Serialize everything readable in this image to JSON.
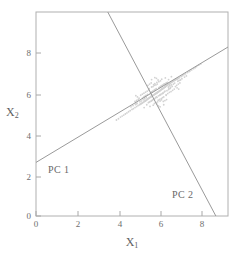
{
  "chart_data": {
    "type": "scatter",
    "title": "",
    "subtitle": "",
    "xlabel": "X1",
    "ylabel": "X2",
    "xlabel_base": "X",
    "xlabel_sub": "1",
    "ylabel_base": "X",
    "ylabel_sub": "2",
    "xlim": [
      0,
      9.5
    ],
    "ylim": [
      0,
      9.9
    ],
    "xticks": [
      0,
      2,
      4,
      6,
      8
    ],
    "yticks": [
      0,
      2,
      4,
      6,
      8
    ],
    "xticklabels": [
      "0",
      "2",
      "4",
      "6",
      "8"
    ],
    "yticklabels": [
      "0",
      "2",
      "4",
      "6",
      "8"
    ],
    "grid": false,
    "legend": false,
    "frame": "box",
    "point_color": "#d2d2d2",
    "line_color": "#9a9a9a",
    "axis_color": "#a8a8a8",
    "text_color": "#6e6e6e",
    "background": "#ffffff",
    "cluster": {
      "center_x": 6.0,
      "center_y": 6.0,
      "n_points": 260,
      "spread_major": 1.05,
      "spread_minor": 0.38,
      "major_axis_angle_deg": 30
    },
    "annotations": [
      {
        "name": "PC 1",
        "label": "PC 1",
        "line": {
          "x1": 0.0,
          "y1": 2.6,
          "x2": 9.5,
          "y2": 8.2
        },
        "slope": 0.59,
        "intercept": 2.6
      },
      {
        "name": "PC 2",
        "label": "PC 2",
        "line": {
          "x1": 3.55,
          "y1": 9.9,
          "x2": 8.9,
          "y2": 0.0
        },
        "slope": -1.85,
        "intercept": 16.5
      }
    ],
    "points": [
      [
        6.02,
        6.01
      ],
      [
        5.84,
        5.88
      ],
      [
        6.24,
        6.17
      ],
      [
        5.62,
        5.74
      ],
      [
        6.41,
        6.29
      ],
      [
        5.95,
        5.96
      ],
      [
        6.13,
        6.08
      ],
      [
        5.73,
        5.81
      ],
      [
        6.33,
        6.22
      ],
      [
        5.51,
        5.66
      ],
      [
        6.55,
        6.38
      ],
      [
        6.07,
        6.04
      ],
      [
        5.89,
        5.92
      ],
      [
        6.19,
        6.13
      ],
      [
        5.67,
        5.78
      ],
      [
        6.46,
        6.33
      ],
      [
        5.99,
        5.99
      ],
      [
        6.28,
        6.19
      ],
      [
        5.78,
        5.85
      ],
      [
        6.37,
        6.25
      ],
      [
        5.56,
        5.7
      ],
      [
        6.6,
        6.41
      ],
      [
        6.1,
        6.06
      ],
      [
        5.92,
        5.94
      ],
      [
        6.22,
        6.15
      ],
      [
        5.7,
        5.8
      ],
      [
        6.49,
        6.35
      ],
      [
        6.01,
        6.0
      ],
      [
        6.31,
        6.21
      ],
      [
        5.81,
        5.87
      ],
      [
        6.4,
        6.27
      ],
      [
        5.59,
        5.72
      ],
      [
        6.64,
        6.44
      ],
      [
        6.04,
        6.02
      ],
      [
        5.86,
        5.9
      ],
      [
        6.16,
        6.11
      ],
      [
        5.64,
        5.76
      ],
      [
        6.43,
        6.31
      ],
      [
        5.97,
        5.97
      ],
      [
        6.26,
        6.18
      ],
      [
        5.75,
        5.83
      ],
      [
        6.35,
        6.24
      ],
      [
        5.53,
        5.68
      ],
      [
        6.57,
        6.4
      ],
      [
        6.09,
        6.05
      ],
      [
        5.91,
        5.93
      ],
      [
        6.21,
        6.14
      ],
      [
        5.69,
        5.79
      ],
      [
        6.48,
        6.34
      ],
      [
        6.0,
        5.98
      ],
      [
        6.3,
        6.2
      ],
      [
        5.8,
        5.86
      ],
      [
        6.39,
        6.26
      ],
      [
        5.58,
        5.71
      ],
      [
        6.62,
        6.43
      ],
      [
        6.12,
        6.07
      ],
      [
        5.94,
        5.95
      ],
      [
        6.24,
        6.16
      ],
      [
        5.72,
        5.82
      ],
      [
        6.51,
        6.36
      ],
      [
        5.4,
        5.58
      ],
      [
        6.72,
        6.5
      ],
      [
        6.85,
        6.58
      ],
      [
        5.28,
        5.5
      ],
      [
        7.0,
        6.66
      ],
      [
        5.15,
        5.42
      ],
      [
        6.9,
        6.61
      ],
      [
        5.35,
        5.55
      ],
      [
        6.78,
        6.54
      ],
      [
        5.22,
        5.46
      ],
      [
        7.1,
        6.72
      ],
      [
        5.05,
        5.36
      ],
      [
        6.95,
        6.64
      ],
      [
        5.45,
        5.61
      ],
      [
        6.68,
        6.47
      ],
      [
        5.32,
        5.53
      ],
      [
        7.05,
        6.69
      ],
      [
        5.18,
        5.44
      ],
      [
        6.82,
        6.56
      ],
      [
        5.25,
        5.48
      ],
      [
        7.18,
        6.77
      ],
      [
        4.98,
        5.31
      ],
      [
        6.88,
        6.6
      ],
      [
        5.42,
        5.6
      ],
      [
        6.75,
        6.52
      ],
      [
        5.12,
        5.4
      ],
      [
        7.25,
        6.81
      ],
      [
        4.9,
        5.26
      ],
      [
        6.98,
        6.65
      ],
      [
        5.38,
        5.57
      ],
      [
        7.32,
        6.86
      ],
      [
        4.82,
        5.21
      ],
      [
        6.92,
        6.62
      ],
      [
        5.48,
        5.63
      ],
      [
        7.4,
        6.9
      ],
      [
        4.75,
        5.17
      ],
      [
        6.08,
        6.22
      ],
      [
        5.96,
        5.78
      ],
      [
        6.3,
        6.38
      ],
      [
        5.76,
        5.62
      ],
      [
        6.18,
        6.3
      ],
      [
        5.88,
        5.7
      ],
      [
        6.42,
        6.44
      ],
      [
        5.64,
        5.55
      ],
      [
        6.26,
        6.34
      ],
      [
        5.8,
        5.66
      ],
      [
        6.5,
        6.48
      ],
      [
        5.56,
        5.5
      ],
      [
        6.14,
        6.26
      ],
      [
        5.92,
        5.74
      ],
      [
        6.36,
        6.41
      ],
      [
        5.7,
        5.58
      ],
      [
        6.22,
        6.32
      ],
      [
        5.84,
        5.68
      ],
      [
        6.46,
        6.46
      ],
      [
        5.6,
        5.53
      ],
      [
        6.1,
        6.24
      ],
      [
        5.99,
        5.76
      ],
      [
        6.34,
        6.4
      ],
      [
        5.73,
        5.6
      ],
      [
        5.9,
        6.14
      ],
      [
        6.12,
        5.86
      ],
      [
        5.78,
        6.06
      ],
      [
        6.24,
        5.94
      ],
      [
        5.68,
        5.99
      ],
      [
        6.35,
        6.02
      ],
      [
        5.84,
        6.1
      ],
      [
        6.18,
        5.9
      ],
      [
        5.72,
        6.02
      ],
      [
        6.29,
        5.97
      ],
      [
        5.95,
        6.18
      ],
      [
        6.06,
        5.83
      ],
      [
        5.66,
        5.95
      ],
      [
        6.38,
        6.06
      ],
      [
        5.87,
        6.12
      ],
      [
        6.15,
        5.89
      ],
      [
        5.75,
        6.04
      ],
      [
        6.27,
        5.95
      ],
      [
        6.55,
        6.26
      ],
      [
        5.46,
        5.74
      ],
      [
        6.62,
        6.32
      ],
      [
        5.38,
        5.69
      ],
      [
        6.7,
        6.36
      ],
      [
        5.3,
        5.64
      ],
      [
        6.58,
        6.18
      ],
      [
        5.43,
        5.82
      ],
      [
        6.66,
        6.24
      ],
      [
        5.35,
        5.77
      ],
      [
        6.74,
        6.29
      ],
      [
        5.27,
        5.72
      ],
      [
        6.48,
        6.08
      ],
      [
        5.52,
        5.9
      ],
      [
        6.56,
        6.14
      ],
      [
        5.44,
        5.85
      ],
      [
        6.64,
        6.19
      ],
      [
        5.36,
        5.8
      ],
      [
        7.5,
        6.96
      ],
      [
        4.66,
        5.11
      ],
      [
        7.58,
        7.01
      ],
      [
        4.58,
        5.06
      ],
      [
        7.15,
        6.6
      ],
      [
        5.0,
        5.48
      ],
      [
        7.22,
        6.66
      ],
      [
        4.92,
        5.43
      ],
      [
        7.35,
        6.74
      ],
      [
        4.8,
        5.36
      ],
      [
        7.44,
        6.8
      ],
      [
        4.7,
        5.3
      ],
      [
        6.05,
        5.62
      ],
      [
        6.0,
        6.4
      ],
      [
        6.2,
        5.7
      ],
      [
        5.85,
        6.34
      ],
      [
        6.32,
        5.78
      ],
      [
        5.72,
        6.26
      ],
      [
        6.44,
        5.86
      ],
      [
        5.6,
        6.18
      ],
      [
        6.12,
        5.66
      ],
      [
        5.93,
        6.36
      ],
      [
        6.26,
        5.74
      ],
      [
        5.79,
        6.28
      ],
      [
        7.62,
        7.04
      ],
      [
        4.5,
        5.0
      ],
      [
        7.7,
        7.09
      ],
      [
        4.42,
        4.95
      ],
      [
        6.8,
        6.4
      ],
      [
        5.2,
        5.58
      ],
      [
        6.86,
        6.45
      ],
      [
        5.14,
        5.54
      ],
      [
        7.02,
        6.54
      ],
      [
        4.99,
        5.45
      ],
      [
        7.08,
        6.58
      ],
      [
        4.93,
        5.41
      ],
      [
        5.98,
        6.48
      ],
      [
        6.02,
        5.54
      ],
      [
        5.88,
        6.42
      ],
      [
        6.14,
        5.58
      ],
      [
        6.08,
        6.52
      ],
      [
        5.94,
        5.5
      ],
      [
        5.82,
        6.38
      ],
      [
        6.21,
        5.64
      ],
      [
        6.16,
        6.56
      ],
      [
        5.86,
        5.46
      ],
      [
        6.04,
        6.6
      ],
      [
        5.98,
        5.43
      ],
      [
        6.68,
        6.04
      ],
      [
        5.34,
        5.96
      ],
      [
        6.76,
        6.1
      ],
      [
        5.26,
        5.91
      ],
      [
        6.84,
        6.16
      ],
      [
        5.18,
        5.86
      ],
      [
        6.52,
        5.94
      ],
      [
        5.5,
        6.06
      ],
      [
        6.6,
        6.0
      ],
      [
        5.42,
        6.01
      ],
      [
        6.44,
        5.88
      ],
      [
        5.58,
        6.12
      ],
      [
        7.8,
        7.15
      ],
      [
        4.34,
        4.9
      ],
      [
        7.88,
        7.2
      ],
      [
        4.26,
        4.85
      ],
      [
        7.95,
        7.25
      ],
      [
        4.18,
        4.8
      ],
      [
        6.96,
        6.34
      ],
      [
        5.06,
        5.66
      ],
      [
        7.04,
        6.4
      ],
      [
        4.98,
        5.61
      ],
      [
        7.12,
        6.46
      ],
      [
        4.9,
        5.56
      ],
      [
        5.7,
        6.46
      ],
      [
        6.3,
        5.56
      ],
      [
        5.62,
        6.4
      ],
      [
        6.38,
        5.6
      ],
      [
        5.54,
        6.34
      ],
      [
        6.46,
        5.65
      ],
      [
        6.9,
        6.28
      ],
      [
        5.1,
        5.72
      ],
      [
        6.98,
        6.22
      ],
      [
        5.02,
        5.78
      ],
      [
        7.06,
        6.16
      ],
      [
        4.94,
        5.84
      ],
      [
        5.96,
        6.68
      ],
      [
        6.06,
        5.34
      ],
      [
        5.88,
        6.72
      ],
      [
        6.14,
        5.3
      ],
      [
        6.22,
        6.64
      ],
      [
        5.8,
        5.38
      ],
      [
        6.4,
        6.7
      ],
      [
        5.64,
        5.32
      ],
      [
        5.72,
        6.62
      ],
      [
        6.32,
        5.4
      ],
      [
        6.56,
        6.62
      ],
      [
        5.48,
        5.4
      ],
      [
        8.05,
        7.32
      ],
      [
        4.08,
        4.72
      ],
      [
        8.15,
        7.38
      ],
      [
        3.98,
        4.66
      ],
      [
        5.35,
        5.26
      ],
      [
        6.7,
        6.76
      ]
    ]
  }
}
